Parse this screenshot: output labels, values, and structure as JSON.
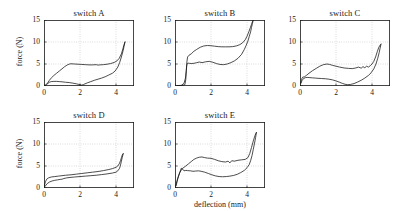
{
  "figure": {
    "background_color": "#ffffff",
    "line_color": "#111111",
    "grid_color": "#9a9a9a"
  },
  "axis": {
    "xlabel": "deflection (mm)",
    "ylabel": "force (N)",
    "xticks": [
      "0",
      "2",
      "4"
    ],
    "yticks": [
      "0",
      "5",
      "10",
      "15"
    ],
    "xlim": [
      0,
      5
    ],
    "ylim": [
      0,
      15
    ]
  },
  "panels": [
    {
      "id": "switch-a",
      "title": "switch A",
      "show_ylabel": true,
      "show_xlabel": false
    },
    {
      "id": "switch-b",
      "title": "switch B",
      "show_ylabel": false,
      "show_xlabel": false
    },
    {
      "id": "switch-c",
      "title": "switch C",
      "show_ylabel": false,
      "show_xlabel": false
    },
    {
      "id": "switch-d",
      "title": "switch D",
      "show_ylabel": true,
      "show_xlabel": false
    },
    {
      "id": "switch-e",
      "title": "switch E",
      "show_ylabel": false,
      "show_xlabel": true
    }
  ],
  "chart_data": [
    {
      "type": "line",
      "title": "switch A",
      "xlabel": "deflection (mm)",
      "ylabel": "force (N)",
      "xlim": [
        0,
        5
      ],
      "ylim": [
        0,
        15
      ],
      "xticks": [
        0,
        2,
        4
      ],
      "yticks": [
        0,
        5,
        10,
        15
      ],
      "grid": true,
      "series": [
        {
          "name": "loading",
          "x": [
            0.05,
            0.12,
            0.2,
            0.3,
            0.42,
            0.55,
            0.7,
            0.85,
            1.0,
            1.15,
            1.3,
            1.42,
            1.5,
            1.7,
            1.9,
            2.1,
            2.3,
            2.5,
            2.7,
            2.9,
            3.0,
            3.1,
            3.3,
            3.5,
            3.7,
            3.9,
            4.05,
            4.18,
            4.3,
            4.38,
            4.44,
            4.48,
            4.5
          ],
          "y": [
            0.1,
            0.35,
            0.7,
            1.3,
            1.9,
            2.4,
            2.9,
            3.4,
            3.9,
            4.4,
            4.8,
            5.0,
            5.05,
            5.0,
            4.95,
            4.9,
            4.85,
            4.8,
            4.8,
            4.85,
            4.75,
            4.8,
            4.85,
            4.95,
            5.1,
            5.35,
            5.7,
            6.3,
            7.3,
            8.4,
            9.3,
            9.8,
            10.0
          ]
        },
        {
          "name": "unloading",
          "x": [
            4.5,
            4.45,
            4.4,
            4.3,
            4.2,
            4.1,
            3.95,
            3.8,
            3.6,
            3.4,
            3.2,
            3.0,
            2.8,
            2.6,
            2.4,
            2.2,
            2.1,
            2.0,
            1.8,
            1.6,
            1.4,
            1.2,
            1.0,
            0.85,
            0.7,
            0.55,
            0.4,
            0.3,
            0.22,
            0.15,
            0.08
          ],
          "y": [
            10.0,
            9.1,
            8.1,
            6.6,
            5.3,
            4.3,
            3.4,
            2.9,
            2.5,
            2.1,
            1.8,
            1.55,
            1.3,
            1.0,
            0.7,
            0.35,
            0.2,
            0.3,
            0.5,
            0.65,
            0.78,
            0.85,
            0.95,
            1.0,
            1.05,
            1.05,
            1.0,
            0.85,
            0.6,
            0.35,
            0.1
          ]
        }
      ]
    },
    {
      "type": "line",
      "title": "switch B",
      "xlabel": "deflection (mm)",
      "ylabel": "force (N)",
      "xlim": [
        0,
        5
      ],
      "ylim": [
        0,
        15
      ],
      "xticks": [
        0,
        2,
        4
      ],
      "yticks": [
        0,
        5,
        10,
        15
      ],
      "grid": true,
      "series": [
        {
          "name": "loading",
          "x": [
            0.15,
            0.3,
            0.45,
            0.55,
            0.6,
            0.63,
            0.66,
            0.7,
            0.78,
            0.9,
            1.05,
            1.2,
            1.4,
            1.6,
            1.8,
            2.0,
            2.2,
            2.4,
            2.6,
            2.8,
            3.0,
            3.2,
            3.4,
            3.6,
            3.75,
            3.9,
            4.0,
            4.1,
            4.18,
            4.25,
            4.3,
            4.35
          ],
          "y": [
            0.05,
            0.1,
            0.15,
            0.3,
            1.5,
            3.5,
            5.5,
            6.6,
            7.0,
            7.3,
            7.9,
            8.3,
            8.8,
            9.1,
            9.2,
            9.15,
            9.05,
            8.95,
            8.9,
            8.9,
            8.9,
            8.95,
            9.1,
            9.4,
            9.8,
            10.5,
            11.3,
            12.3,
            13.2,
            14.0,
            14.6,
            15.0
          ]
        },
        {
          "name": "unloading",
          "x": [
            4.35,
            4.3,
            4.25,
            4.2,
            4.12,
            4.05,
            3.95,
            3.85,
            3.7,
            3.5,
            3.3,
            3.1,
            2.9,
            2.7,
            2.5,
            2.3,
            2.1,
            1.9,
            1.7,
            1.5,
            1.35,
            1.2,
            1.05,
            0.9,
            0.8,
            0.72,
            0.68,
            0.65,
            0.62,
            0.58,
            0.5,
            0.35,
            0.2,
            0.1
          ],
          "y": [
            15.0,
            14.2,
            13.3,
            12.3,
            11.2,
            10.2,
            9.2,
            8.3,
            7.2,
            6.3,
            5.7,
            5.3,
            5.0,
            4.85,
            4.9,
            5.1,
            5.4,
            5.6,
            5.5,
            5.3,
            5.45,
            5.3,
            5.15,
            5.1,
            5.15,
            5.2,
            5.1,
            4.6,
            3.3,
            1.8,
            0.6,
            0.15,
            0.08,
            0.05
          ]
        }
      ]
    },
    {
      "type": "line",
      "title": "switch C",
      "xlabel": "deflection (mm)",
      "ylabel": "force (N)",
      "xlim": [
        0,
        5
      ],
      "ylim": [
        0,
        15
      ],
      "xticks": [
        0,
        2,
        4
      ],
      "yticks": [
        0,
        5,
        10,
        15
      ],
      "grid": true,
      "series": [
        {
          "name": "loading",
          "x": [
            0.03,
            0.08,
            0.15,
            0.25,
            0.35,
            0.5,
            0.7,
            0.9,
            1.1,
            1.3,
            1.5,
            1.65,
            1.8,
            2.0,
            2.2,
            2.45,
            2.7,
            2.9,
            3.1,
            3.25,
            3.4,
            3.5,
            3.6,
            3.7,
            3.8,
            3.9,
            4.0,
            4.1,
            4.2,
            4.3,
            4.38,
            4.45,
            4.5
          ],
          "y": [
            0.6,
            1.5,
            2.0,
            2.1,
            2.4,
            2.9,
            3.5,
            4.0,
            4.5,
            4.85,
            5.0,
            4.9,
            4.7,
            4.5,
            4.3,
            4.1,
            4.0,
            3.95,
            4.1,
            4.3,
            4.05,
            4.4,
            4.15,
            4.5,
            4.3,
            4.6,
            5.0,
            5.6,
            6.6,
            7.9,
            8.8,
            9.3,
            9.5
          ]
        },
        {
          "name": "unloading",
          "x": [
            4.5,
            4.45,
            4.4,
            4.32,
            4.22,
            4.1,
            3.95,
            3.8,
            3.6,
            3.4,
            3.2,
            3.0,
            2.8,
            2.65,
            2.5,
            2.35,
            2.2,
            2.0,
            1.8,
            1.6,
            1.4,
            1.2,
            1.0,
            0.85,
            0.7,
            0.55,
            0.4,
            0.3,
            0.2,
            0.12,
            0.05
          ],
          "y": [
            9.5,
            8.6,
            7.6,
            6.3,
            5.0,
            3.9,
            3.0,
            2.4,
            1.8,
            1.3,
            0.9,
            0.55,
            0.35,
            0.3,
            0.4,
            0.6,
            0.85,
            1.15,
            1.4,
            1.55,
            1.65,
            1.7,
            1.75,
            1.8,
            1.85,
            1.9,
            1.95,
            1.9,
            1.7,
            1.3,
            0.6
          ]
        }
      ]
    },
    {
      "type": "line",
      "title": "switch D",
      "xlabel": "deflection (mm)",
      "ylabel": "force (N)",
      "xlim": [
        0,
        5
      ],
      "ylim": [
        0,
        15
      ],
      "xticks": [
        0,
        2,
        4
      ],
      "yticks": [
        0,
        5,
        10,
        15
      ],
      "grid": true,
      "series": [
        {
          "name": "loading",
          "x": [
            0.02,
            0.08,
            0.15,
            0.25,
            0.4,
            0.6,
            0.8,
            1.0,
            1.2,
            1.5,
            1.8,
            2.1,
            2.4,
            2.7,
            3.0,
            3.3,
            3.6,
            3.8,
            4.0,
            4.1,
            4.18,
            4.25,
            4.3,
            4.35,
            4.4
          ],
          "y": [
            0.5,
            1.4,
            2.0,
            2.3,
            2.5,
            2.6,
            2.7,
            2.8,
            2.9,
            3.0,
            3.15,
            3.3,
            3.45,
            3.6,
            3.75,
            3.95,
            4.2,
            4.4,
            4.7,
            5.0,
            5.5,
            6.2,
            6.9,
            7.5,
            7.8
          ]
        },
        {
          "name": "unloading",
          "x": [
            4.4,
            4.35,
            4.3,
            4.25,
            4.2,
            4.1,
            4.0,
            3.8,
            3.5,
            3.2,
            2.9,
            2.6,
            2.3,
            2.0,
            1.7,
            1.45,
            1.25,
            1.1,
            1.0,
            0.9,
            0.75,
            0.6,
            0.45,
            0.3,
            0.18,
            0.08,
            0.02
          ],
          "y": [
            7.8,
            7.0,
            6.1,
            5.2,
            4.5,
            3.9,
            3.6,
            3.4,
            3.2,
            3.05,
            2.9,
            2.8,
            2.7,
            2.6,
            2.5,
            2.4,
            2.3,
            2.15,
            2.0,
            1.95,
            1.85,
            1.75,
            1.6,
            1.35,
            1.0,
            0.5,
            0.2
          ]
        }
      ]
    },
    {
      "type": "line",
      "title": "switch E",
      "xlabel": "deflection (mm)",
      "ylabel": "force (N)",
      "xlim": [
        0,
        5
      ],
      "ylim": [
        0,
        15
      ],
      "xticks": [
        0,
        2,
        4
      ],
      "yticks": [
        0,
        5,
        10,
        15
      ],
      "grid": true,
      "series": [
        {
          "name": "loading",
          "x": [
            0.03,
            0.1,
            0.18,
            0.28,
            0.4,
            0.5,
            0.6,
            0.75,
            0.9,
            1.05,
            1.2,
            1.35,
            1.5,
            1.65,
            1.8,
            2.0,
            2.2,
            2.4,
            2.6,
            2.8,
            2.95,
            3.05,
            3.15,
            3.3,
            3.5,
            3.7,
            3.9,
            4.05,
            4.15,
            4.25,
            4.35,
            4.45,
            4.52
          ],
          "y": [
            0.4,
            1.5,
            2.6,
            3.6,
            4.4,
            4.7,
            5.0,
            5.5,
            6.0,
            6.5,
            6.8,
            7.0,
            7.05,
            6.9,
            6.8,
            6.75,
            6.5,
            6.2,
            6.0,
            5.9,
            6.1,
            5.7,
            6.2,
            6.1,
            6.3,
            6.4,
            6.5,
            6.9,
            7.8,
            9.2,
            10.7,
            12.0,
            12.6
          ]
        },
        {
          "name": "unloading",
          "x": [
            4.52,
            4.48,
            4.42,
            4.35,
            4.28,
            4.2,
            4.12,
            4.0,
            3.85,
            3.65,
            3.45,
            3.25,
            3.05,
            2.85,
            2.65,
            2.45,
            2.25,
            2.05,
            1.85,
            1.65,
            1.45,
            1.3,
            1.15,
            1.0,
            0.85,
            0.7,
            0.6,
            0.5,
            0.42,
            0.35,
            0.25,
            0.15,
            0.06
          ],
          "y": [
            12.6,
            11.5,
            10.2,
            8.8,
            7.4,
            6.2,
            5.3,
            4.6,
            4.0,
            3.5,
            3.1,
            2.85,
            2.7,
            2.6,
            2.55,
            2.6,
            2.75,
            3.0,
            3.3,
            3.6,
            3.8,
            3.9,
            3.85,
            3.8,
            3.9,
            3.95,
            4.0,
            3.9,
            4.3,
            4.5,
            3.4,
            2.0,
            0.5
          ]
        }
      ]
    }
  ]
}
